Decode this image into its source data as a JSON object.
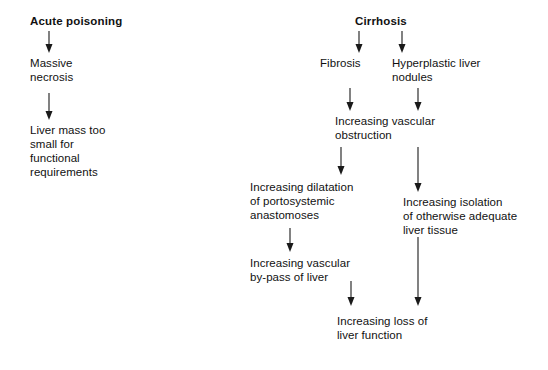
{
  "diagram": {
    "type": "flowchart",
    "title_left": "Acute poisoning",
    "title_right": "Cirrhosis",
    "background_color": "#ffffff",
    "text_color": "#111111",
    "arrow_color": "#1a1a1a",
    "nodes": [
      {
        "id": "acute-poisoning",
        "label": "Acute poisoning",
        "heading": true,
        "x": 30,
        "y": 14,
        "align": "left"
      },
      {
        "id": "massive-necrosis",
        "label": "Massive\nnecrosis",
        "heading": false,
        "x": 30,
        "y": 56,
        "align": "left"
      },
      {
        "id": "liver-mass-too-small",
        "label": "Liver mass too\nsmall for\nfunctional\nrequirements",
        "heading": false,
        "x": 30,
        "y": 123,
        "align": "left"
      },
      {
        "id": "cirrhosis",
        "label": "Cirrhosis",
        "heading": true,
        "x": 355,
        "y": 14,
        "align": "left"
      },
      {
        "id": "fibrosis",
        "label": "Fibrosis",
        "heading": false,
        "x": 320,
        "y": 56,
        "align": "left"
      },
      {
        "id": "hyperplastic-liver-nodules",
        "label": "Hyperplastic liver\nnodules",
        "heading": false,
        "x": 392,
        "y": 56,
        "align": "left"
      },
      {
        "id": "increasing-vascular-obstruction",
        "label": "Increasing vascular\nobstruction",
        "heading": false,
        "x": 335,
        "y": 114,
        "align": "left"
      },
      {
        "id": "increasing-dilatation-portosystemic",
        "label": "Increasing dilatation\nof portosystemic\nanastomoses",
        "heading": false,
        "x": 250,
        "y": 180,
        "align": "left"
      },
      {
        "id": "increasing-isolation-liver-tissue",
        "label": "Increasing isolation\nof otherwise adequate\nliver tissue",
        "heading": false,
        "x": 403,
        "y": 195,
        "align": "left"
      },
      {
        "id": "increasing-vascular-bypass",
        "label": "Increasing vascular\nby-pass of liver",
        "heading": false,
        "x": 250,
        "y": 256,
        "align": "left"
      },
      {
        "id": "increasing-loss-liver-function",
        "label": "Increasing loss of\nliver function",
        "heading": false,
        "x": 337,
        "y": 314,
        "align": "left"
      }
    ],
    "arrows": [
      {
        "id": "arrow-acute-to-necrosis",
        "x": 49,
        "y1": 31,
        "y2": 53
      },
      {
        "id": "arrow-necrosis-to-livermass",
        "x": 49,
        "y1": 93,
        "y2": 120
      },
      {
        "id": "arrow-cirrhosis-to-fibrosis",
        "x": 359,
        "y1": 31,
        "y2": 53
      },
      {
        "id": "arrow-cirrhosis-to-nodules",
        "x": 402,
        "y1": 31,
        "y2": 53
      },
      {
        "id": "arrow-fibrosis-to-obstruction",
        "x": 350,
        "y1": 88,
        "y2": 111
      },
      {
        "id": "arrow-nodules-to-isolation-upper",
        "x": 418,
        "y1": 88,
        "y2": 111
      },
      {
        "id": "arrow-obstruction-to-dilatation",
        "x": 341,
        "y1": 147,
        "y2": 175
      },
      {
        "id": "arrow-obstruction-to-isolation",
        "x": 418,
        "y1": 147,
        "y2": 192
      },
      {
        "id": "arrow-dilatation-to-bypass",
        "x": 290,
        "y1": 228,
        "y2": 252
      },
      {
        "id": "arrow-bypass-to-loss",
        "x": 351,
        "y1": 281,
        "y2": 306
      },
      {
        "id": "arrow-isolation-to-loss",
        "x": 418,
        "y1": 237,
        "y2": 306
      }
    ]
  }
}
